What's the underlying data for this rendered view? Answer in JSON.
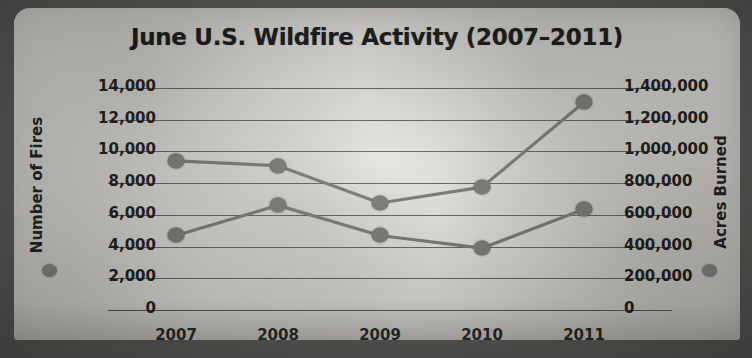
{
  "chart_data": {
    "type": "line",
    "title": "June U.S. Wildfire Activity (2007–2011)",
    "xlabel": "",
    "categories": [
      "2007",
      "2008",
      "2009",
      "2010",
      "2011"
    ],
    "grid": true,
    "legend_position": "axis-titles",
    "axes": {
      "left": {
        "label": "Number of Fires",
        "ticks": [
          "0",
          "2,000",
          "4,000",
          "6,000",
          "8,000",
          "10,000",
          "12,000",
          "14,000"
        ],
        "tick_values": [
          0,
          2000,
          4000,
          6000,
          8000,
          10000,
          12000,
          14000
        ],
        "ylim": [
          0,
          14000
        ]
      },
      "right": {
        "label": "Acres Burned",
        "ticks": [
          "0",
          "200,000",
          "400,000",
          "600,000",
          "800,000",
          "1,000,000",
          "1,200,000",
          "1,400,000"
        ],
        "tick_values": [
          0,
          200000,
          400000,
          600000,
          800000,
          1000000,
          1200000,
          1400000
        ],
        "ylim": [
          0,
          1400000
        ]
      }
    },
    "series": [
      {
        "name": "Acres Burned",
        "axis": "right",
        "color": "#7d7d7b",
        "values": [
          940000,
          910000,
          675000,
          775000,
          1310000
        ]
      },
      {
        "name": "Number of Fires",
        "axis": "left",
        "color": "#7d7d7b",
        "values": [
          4700,
          6600,
          4700,
          3900,
          6350
        ]
      }
    ]
  }
}
